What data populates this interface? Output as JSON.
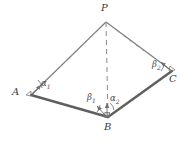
{
  "figure": {
    "background_color": "#ffffff",
    "stroke_color": "#6e6e6e",
    "base_stroke_color": "#5a5a5a",
    "label_color": "#3c3c3c",
    "vertices": [
      {
        "id": "P",
        "label": "P",
        "x": 106,
        "y": 22,
        "label_x": 101,
        "label_y": 4
      },
      {
        "id": "A",
        "label": "A",
        "x": 31,
        "y": 95,
        "label_x": 12,
        "label_y": 85
      },
      {
        "id": "B",
        "label": "B",
        "x": 108,
        "y": 117,
        "label_x": 104,
        "label_y": 121
      },
      {
        "id": "C",
        "label": "C",
        "x": 172,
        "y": 71,
        "label_x": 169,
        "label_y": 73
      }
    ],
    "edges": [
      {
        "name": "edge-PA",
        "from": "P",
        "to": "A",
        "style": "solid"
      },
      {
        "name": "edge-PC",
        "from": "P",
        "to": "C",
        "style": "solid"
      },
      {
        "name": "edge-PB",
        "from": "P",
        "to": "B",
        "style": "dashed"
      },
      {
        "name": "edge-AB",
        "from": "A",
        "to": "B",
        "style": "solid-thick"
      },
      {
        "name": "edge-BC",
        "from": "B",
        "to": "C",
        "style": "solid-thick"
      }
    ],
    "angles": [
      {
        "id": "alpha1",
        "label": "α",
        "sub": "1",
        "at": "A",
        "x": 41,
        "y": 82
      },
      {
        "id": "alpha2",
        "label": "α",
        "sub": "2",
        "at": "B",
        "x": 110,
        "y": 97
      },
      {
        "id": "beta1",
        "label": "β",
        "sub": "1",
        "at": "B",
        "x": 88,
        "y": 96
      },
      {
        "id": "beta2",
        "label": "β",
        "sub": "2",
        "at": "C",
        "x": 153,
        "y": 63
      }
    ],
    "markers": [
      {
        "name": "right-angle-marker-B",
        "x": 108,
        "y": 117
      },
      {
        "name": "vertex-marker-A",
        "x": 31,
        "y": 95
      },
      {
        "name": "vertex-marker-C",
        "x": 172,
        "y": 71
      }
    ]
  }
}
